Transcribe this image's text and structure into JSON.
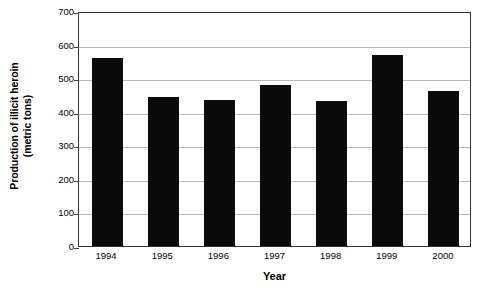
{
  "chart_data": {
    "type": "bar",
    "title": "",
    "categories": [
      "1994",
      "1995",
      "1996",
      "1997",
      "1998",
      "1999",
      "2000"
    ],
    "values": [
      560,
      445,
      435,
      480,
      432,
      570,
      462
    ],
    "xlabel": "Year",
    "ylabel": "Production of illicit heroin (metric tons)",
    "ylabel_line1": "Production of illicit heroin",
    "ylabel_line2": "(metric tons)",
    "ylim": [
      0,
      700
    ],
    "ytick_labels": [
      "0",
      "100",
      "200",
      "300",
      "400",
      "500",
      "600",
      "700"
    ],
    "ytick_values": [
      0,
      100,
      200,
      300,
      400,
      500,
      600,
      700
    ],
    "grid": true,
    "legend": false,
    "bar_color": "#0a0a0a",
    "gridline_color": "#b9b9b9",
    "axis_color": "#333333",
    "background_color": "#ffffff"
  }
}
